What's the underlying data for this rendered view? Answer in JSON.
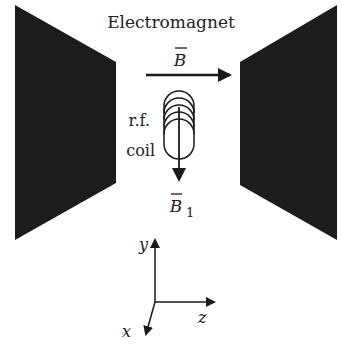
{
  "title": "Electromagnet",
  "labels": {
    "field": "B",
    "coil_line1": "r.f.",
    "coil_line2": "coil",
    "rf_field": "B",
    "rf_field_sub": "1",
    "axis_y": "y",
    "axis_z": "z",
    "axis_x": "x"
  },
  "colors": {
    "magnet": "#1c1c1c",
    "stroke": "#1a1a1a"
  }
}
